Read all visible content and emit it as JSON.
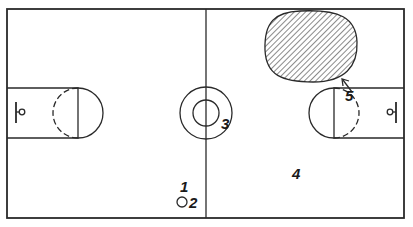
{
  "diagram": {
    "markers": [
      {
        "id": "1",
        "label": "1",
        "meaning": "player mark"
      },
      {
        "id": "2",
        "label": "2",
        "meaning": "ball / player position"
      },
      {
        "id": "3",
        "label": "3",
        "meaning": "center circle"
      },
      {
        "id": "4",
        "label": "4",
        "meaning": "court half"
      },
      {
        "id": "5",
        "label": "5",
        "meaning": "shaded zone"
      }
    ],
    "colors": {
      "ink": "#2a2a2a",
      "background": "#ffffff"
    }
  }
}
